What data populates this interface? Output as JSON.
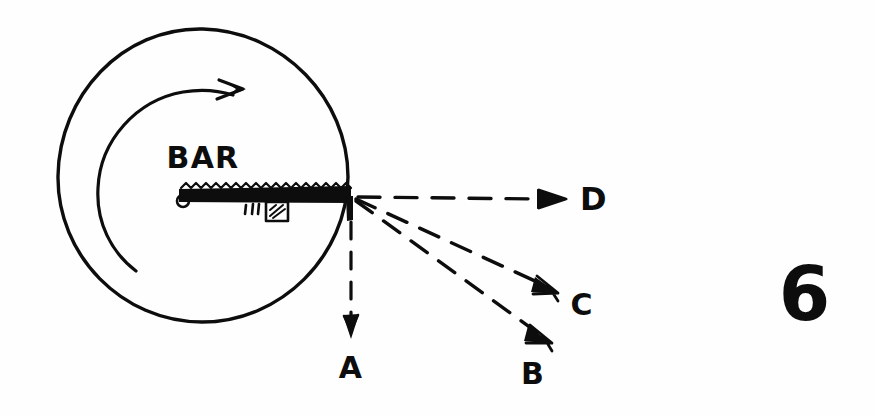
{
  "figure": {
    "number": "6",
    "style": "hand-drawn-sketch",
    "ink_color": "#0d0d0d",
    "background_color": "#fefefe",
    "labels": {
      "bar": "BAR",
      "path_a": "A",
      "path_b": "B",
      "path_c": "C",
      "path_d": "D"
    },
    "elements": {
      "disk": {
        "name": "rotating-disk",
        "center": [
          203,
          175
        ],
        "radius": 146
      },
      "rotation_arc": {
        "name": "rotation-direction-arc",
        "center": [
          203,
          175
        ],
        "radius": 100,
        "direction": "clockwise",
        "arrowhead_at": [
          240,
          88
        ]
      },
      "bar": {
        "name": "bar",
        "pivot": [
          182,
          198
        ],
        "tip": [
          350,
          197
        ],
        "length": 168,
        "hatched_top": true,
        "block_marker": true
      },
      "trajectories": [
        {
          "id": "A",
          "from": [
            351,
            200
          ],
          "to": [
            351,
            330
          ],
          "label_at": [
            351,
            368
          ],
          "kind": "straight-down"
        },
        {
          "id": "B",
          "from": [
            355,
            199
          ],
          "to": [
            549,
            341
          ],
          "label_at": [
            533,
            374
          ],
          "kind": "steep-diagonal"
        },
        {
          "id": "C",
          "from": [
            355,
            197
          ],
          "to": [
            556,
            292
          ],
          "label_at": [
            582,
            305
          ],
          "kind": "shallow-diagonal"
        },
        {
          "id": "D",
          "from": [
            357,
            196
          ],
          "to": [
            566,
            200
          ],
          "label_at": [
            594,
            206
          ],
          "kind": "horizontal"
        }
      ]
    }
  }
}
